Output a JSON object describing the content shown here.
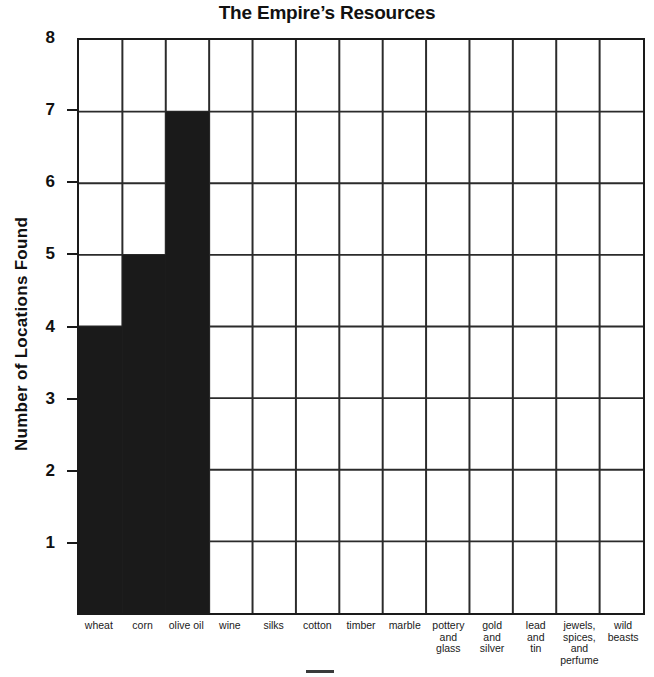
{
  "chart_data": {
    "type": "bar",
    "title": "The Empire’s Resources",
    "xlabel": "",
    "ylabel": "Number of Locations Found",
    "ylim": [
      0,
      8
    ],
    "ytick_labels": [
      "1",
      "2",
      "3",
      "4",
      "5",
      "6",
      "7",
      "8"
    ],
    "ytick_values": [
      1,
      2,
      3,
      4,
      5,
      6,
      7,
      8
    ],
    "grid": true,
    "legend": false,
    "bar_color": "#1a1a1a",
    "grid_color": "#2b2b2b",
    "categories": [
      "wheat",
      "corn",
      "olive oil",
      "wine",
      "silks",
      "cotton",
      "timber",
      "marble",
      "pottery and glass",
      "gold and silver",
      "lead and tin",
      "jewels, spices, and perfume",
      "wild beasts"
    ],
    "category_label_lines": [
      [
        "wheat"
      ],
      [
        "corn"
      ],
      [
        "olive oil"
      ],
      [
        "wine"
      ],
      [
        "silks"
      ],
      [
        "cotton"
      ],
      [
        "timber"
      ],
      [
        "marble"
      ],
      [
        "pottery",
        "and",
        "glass"
      ],
      [
        "gold",
        "and",
        "silver"
      ],
      [
        "lead",
        "and",
        "tin"
      ],
      [
        "jewels,",
        "spices,",
        "and",
        "perfume"
      ],
      [
        "wild",
        "beasts"
      ]
    ],
    "values": [
      4,
      5,
      7,
      0,
      0,
      0,
      0,
      0,
      0,
      0,
      0,
      0,
      0
    ]
  }
}
